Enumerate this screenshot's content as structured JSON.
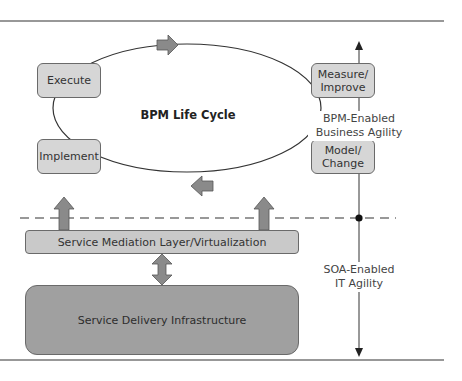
{
  "diagram": {
    "lifecycle": {
      "title": "BPM Life Cycle",
      "stages": [
        {
          "id": "execute",
          "label": "Execute"
        },
        {
          "id": "measure",
          "label": "Measure/\nImprove"
        },
        {
          "id": "implement",
          "label": "Implement"
        },
        {
          "id": "model",
          "label": "Model/\nChange"
        }
      ]
    },
    "layers": {
      "mediation": "Service Mediation Layer/Virtualization",
      "delivery": "Service Delivery Infrastructure"
    },
    "axis": {
      "upper_label_line1": "BPM-Enabled",
      "upper_label_line2": "Business Agility",
      "lower_label_line1": "SOA-Enabled",
      "lower_label_line2": "IT Agility"
    },
    "colors": {
      "stage_fill": "#d6d6d6",
      "mediation_fill": "#c9c9c9",
      "delivery_fill": "#9e9e9e",
      "arrow_fill": "#8a8a8a",
      "line": "#333333"
    }
  }
}
